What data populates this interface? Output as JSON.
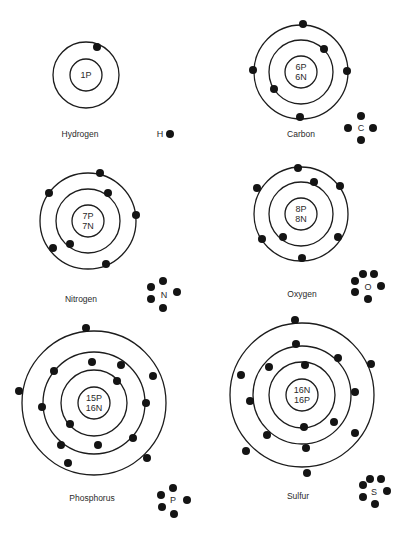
{
  "diagram": {
    "colors": {
      "line": "#1c1c1c",
      "electron": "#141414",
      "text": "#2a2a2a",
      "background": "#ffffff"
    },
    "atoms": [
      {
        "id": "hydrogen",
        "name": "Hydrogen",
        "symbol": "H",
        "nucleus_lines": [
          "1P"
        ],
        "center": [
          86,
          75
        ],
        "nucleus_r": 16,
        "rings": [
          33
        ],
        "electrons": [
          [
            97,
            47
          ]
        ],
        "label_pos": [
          80,
          137
        ],
        "symbol_pos": [
          160,
          137
        ],
        "dots": [
          [
            170,
            134
          ]
        ],
        "dot_count": 1
      },
      {
        "id": "carbon",
        "name": "Carbon",
        "symbol": "C",
        "nucleus_lines": [
          "6P",
          "6N"
        ],
        "center": [
          301,
          72
        ],
        "nucleus_r": 16,
        "rings": [
          32,
          47
        ],
        "electrons": [
          [
            303,
            24
          ],
          [
            347,
            71
          ],
          [
            300,
            117
          ],
          [
            253,
            70
          ],
          [
            324,
            49
          ],
          [
            274,
            89
          ]
        ],
        "label_pos": [
          301,
          137
        ],
        "symbol_pos": [
          361,
          131
        ],
        "dots": [
          [
            361,
            116
          ],
          [
            348,
            128
          ],
          [
            373,
            128
          ],
          [
            361,
            140
          ]
        ],
        "dot_count": 4
      },
      {
        "id": "nitrogen",
        "name": "Nitrogen",
        "symbol": "N",
        "nucleus_lines": [
          "7P",
          "7N"
        ],
        "center": [
          88,
          221
        ],
        "nucleus_r": 16,
        "rings": [
          32,
          48
        ],
        "electrons": [
          [
            100,
            173
          ],
          [
            49,
            193
          ],
          [
            136,
            215
          ],
          [
            53,
            248
          ],
          [
            106,
            264
          ],
          [
            108,
            193
          ],
          [
            70,
            244
          ]
        ],
        "label_pos": [
          81,
          302
        ],
        "symbol_pos": [
          164,
          298
        ],
        "dots": [
          [
            163,
            281
          ],
          [
            151,
            287
          ],
          [
            177,
            292
          ],
          [
            151,
            299
          ],
          [
            163,
            308
          ]
        ],
        "dot_count": 5
      },
      {
        "id": "oxygen",
        "name": "Oxygen",
        "symbol": "O",
        "nucleus_lines": [
          "8P",
          "8N"
        ],
        "center": [
          301,
          214
        ],
        "nucleus_r": 16,
        "rings": [
          32,
          47
        ],
        "electrons": [
          [
            298,
            168
          ],
          [
            340,
            186
          ],
          [
            257,
            188
          ],
          [
            262,
            239
          ],
          [
            338,
            237
          ],
          [
            302,
            258
          ],
          [
            314,
            182
          ],
          [
            283,
            237
          ]
        ],
        "label_pos": [
          302,
          297
        ],
        "symbol_pos": [
          368,
          290
        ],
        "dots": [
          [
            363,
            274
          ],
          [
            374,
            274
          ],
          [
            355,
            281
          ],
          [
            381,
            286
          ],
          [
            355,
            292
          ],
          [
            368,
            299
          ]
        ],
        "dot_count": 6
      },
      {
        "id": "phosphorus",
        "name": "Phosphorus",
        "symbol": "P",
        "nucleus_lines": [
          "15P",
          "16N"
        ],
        "center": [
          94,
          403
        ],
        "nucleus_r": 16,
        "rings": [
          33,
          51,
          72
        ],
        "electrons": [
          [
            86,
            328
          ],
          [
            19,
            391
          ],
          [
            153,
            376
          ],
          [
            147,
            458
          ],
          [
            68,
            463
          ],
          [
            61,
            445
          ],
          [
            92,
            362
          ],
          [
            121,
            365
          ],
          [
            54,
            371
          ],
          [
            42,
            407
          ],
          [
            146,
            403
          ],
          [
            133,
            438
          ],
          [
            98,
            445
          ],
          [
            117,
            381
          ],
          [
            70,
            424
          ]
        ],
        "label_pos": [
          92,
          501
        ],
        "symbol_pos": [
          173,
          503
        ],
        "dots": [
          [
            173,
            488
          ],
          [
            161,
            495
          ],
          [
            187,
            500
          ],
          [
            162,
            507
          ],
          [
            174,
            514
          ]
        ],
        "dot_count": 5
      },
      {
        "id": "sulfur",
        "name": "Sulfur",
        "symbol": "S",
        "nucleus_lines": [
          "16N",
          "16P"
        ],
        "center": [
          302,
          395
        ],
        "nucleus_r": 16,
        "rings": [
          33,
          49,
          72
        ],
        "electrons": [
          [
            295,
            320
          ],
          [
            296,
            344
          ],
          [
            338,
            358
          ],
          [
            371,
            364
          ],
          [
            241,
            375
          ],
          [
            269,
            367
          ],
          [
            305,
            365
          ],
          [
            250,
            401
          ],
          [
            355,
            392
          ],
          [
            334,
            422
          ],
          [
            267,
            435
          ],
          [
            304,
            427
          ],
          [
            355,
            433
          ],
          [
            246,
            451
          ],
          [
            306,
            448
          ],
          [
            307,
            473
          ]
        ],
        "label_pos": [
          298,
          499
        ],
        "symbol_pos": [
          374,
          495
        ],
        "dots": [
          [
            370,
            479
          ],
          [
            381,
            479
          ],
          [
            363,
            485
          ],
          [
            387,
            491
          ],
          [
            363,
            497
          ],
          [
            375,
            504
          ]
        ],
        "dot_count": 6
      }
    ]
  }
}
